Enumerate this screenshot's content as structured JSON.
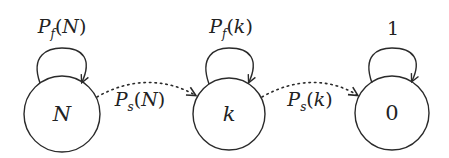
{
  "diagram": {
    "type": "state-transition",
    "stroke_color": "#2a2a2a",
    "nodes": [
      {
        "id": "N",
        "label": "N",
        "italic": true,
        "self_loop_label": {
          "main": "P",
          "sub": "f",
          "arg": "N"
        }
      },
      {
        "id": "k",
        "label": "k",
        "italic": true,
        "self_loop_label": {
          "main": "P",
          "sub": "f",
          "arg": "k"
        }
      },
      {
        "id": "0",
        "label": "0",
        "italic": false,
        "self_loop_label": {
          "text": "1"
        }
      }
    ],
    "edges": [
      {
        "from": "N",
        "to": "k",
        "style": "dotted",
        "label": {
          "main": "P",
          "sub": "s",
          "arg": "N"
        }
      },
      {
        "from": "k",
        "to": "0",
        "style": "dotted",
        "label": {
          "main": "P",
          "sub": "s",
          "arg": "k"
        }
      }
    ]
  }
}
